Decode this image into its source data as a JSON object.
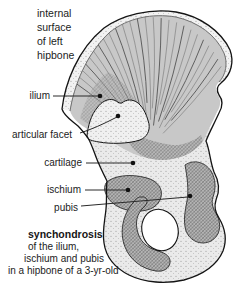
{
  "figure": {
    "title_lines": [
      "internal",
      "surface",
      "of left",
      "hipbone"
    ],
    "labels": [
      {
        "id": "ilium",
        "text": "ilium"
      },
      {
        "id": "articular-facet",
        "text": "articular facet"
      },
      {
        "id": "cartilage",
        "text": "cartilage"
      },
      {
        "id": "ischium",
        "text": "ischium"
      },
      {
        "id": "pubis",
        "text": "pubis"
      }
    ],
    "caption": {
      "term": "synchondrosis",
      "lines": [
        "of the ilium,",
        "ischium and pubis",
        "in a hipbone of a 3-yr-old"
      ]
    },
    "colors": {
      "ink": "#1c1c1c",
      "outline": "#141414",
      "bone_fill": "#c8c8c8",
      "cartilage_fill": "#eaeaea",
      "hatch_fill": "#b5b5b5",
      "background": "#ffffff"
    }
  }
}
